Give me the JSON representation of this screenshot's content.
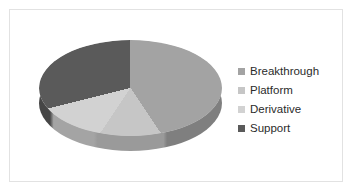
{
  "chart_data": {
    "type": "pie",
    "title": "",
    "subtitle": "",
    "xlabel": "",
    "ylabel": "",
    "three_d": true,
    "grid": false,
    "legend_position": "right",
    "categories": [
      "Breakthrough",
      "Platform",
      "Derivative",
      "Support"
    ],
    "values": [
      40.5,
      19,
      11.5,
      29
    ],
    "unit": "percent",
    "start_angle_deg": 0,
    "direction": "clockwise",
    "slice_angles_deg": [
      146,
      68,
      42,
      104
    ],
    "colors": [
      "#a3a3a3",
      "#c6c6c6",
      "#d2d2d2",
      "#5a5a5a"
    ],
    "data_labels_shown": false
  },
  "legend": {
    "items": [
      {
        "label": "Breakthrough",
        "color": "#a3a3a3"
      },
      {
        "label": "Platform",
        "color": "#c6c6c6"
      },
      {
        "label": "Derivative",
        "color": "#d2d2d2"
      },
      {
        "label": "Support",
        "color": "#5a5a5a"
      }
    ]
  },
  "frame": {
    "border_color": "#e2e2e2",
    "background": "#ffffff"
  }
}
